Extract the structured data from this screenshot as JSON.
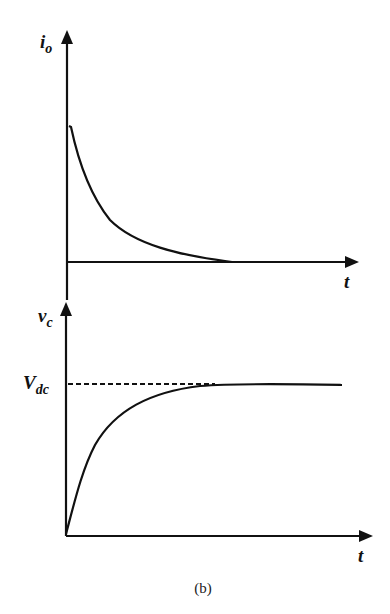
{
  "figure": {
    "caption": "(b)",
    "top_plot": {
      "y_label_main": "i",
      "y_label_sub": "o",
      "x_label": "t",
      "curve": "exponential decay",
      "description": "Output current i_o decays exponentially from an initial peak to zero"
    },
    "bottom_plot": {
      "y_label_main": "v",
      "y_label_sub": "c",
      "x_label": "t",
      "level_label_main": "V",
      "level_label_sub": "dc",
      "curve": "exponential rise",
      "description": "Capacitor voltage v_c rises exponentially from zero toward V_dc (dashed asymptote)"
    },
    "colors": {
      "stroke": "#111111",
      "background": "#ffffff"
    }
  }
}
